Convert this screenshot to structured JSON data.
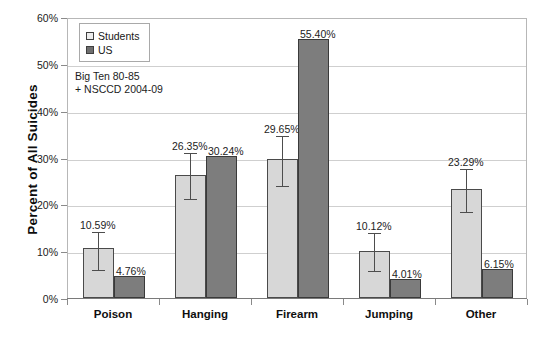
{
  "chart_data": {
    "type": "bar",
    "title": "",
    "subtitle": "",
    "xlabel": "",
    "ylabel": "Percent of All Suicides",
    "ylim": [
      0,
      60
    ],
    "ytick_step": 10,
    "ytick_labels": [
      "0%",
      "10%",
      "20%",
      "30%",
      "40%",
      "50%",
      "60%"
    ],
    "ytick_values": [
      0,
      10,
      20,
      30,
      40,
      50,
      60
    ],
    "grid": true,
    "grid_axis": "y",
    "legend_position": "top-left",
    "categories": [
      "Poison",
      "Hanging",
      "Firearm",
      "Jumping",
      "Other"
    ],
    "series": [
      {
        "name": "Students",
        "color": "#d7d7d7",
        "values": [
          10.59,
          26.35,
          29.65,
          10.12,
          23.29
        ],
        "data_labels": [
          "10.59%",
          "26.35%",
          "29.65%",
          "10.12%",
          "23.29%"
        ],
        "error_bars": [
          {
            "low": 6.2,
            "high": 14.6
          },
          {
            "low": 21.3,
            "high": 31.4
          },
          {
            "low": 24.2,
            "high": 35.1
          },
          {
            "low": 5.9,
            "high": 14.3
          },
          {
            "low": 18.6,
            "high": 28.0
          }
        ]
      },
      {
        "name": "US",
        "color": "#7d7d7d",
        "values": [
          4.76,
          30.24,
          55.4,
          4.01,
          6.15
        ],
        "data_labels": [
          "4.76%",
          "30.24%",
          "55.40%",
          "4.01%",
          "6.15%"
        ],
        "error_bars": [
          null,
          null,
          null,
          null,
          null
        ]
      }
    ],
    "annotations": [
      {
        "name": "source-note",
        "lines": [
          "Big  Ten 80-85",
          "+ NSCCD 2004-09"
        ]
      }
    ]
  },
  "legend": {
    "items": [
      {
        "label": "Students",
        "swatch": "students"
      },
      {
        "label": "US",
        "swatch": "us"
      }
    ]
  },
  "annotation": {
    "line1": "Big  Ten 80-85",
    "line2": "+ NSCCD 2004-09"
  },
  "axes": {
    "y_title": "Percent of All Suicides"
  }
}
